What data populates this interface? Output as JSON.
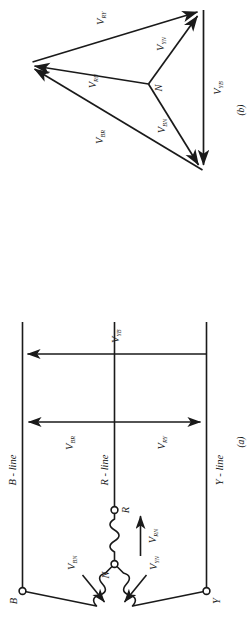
{
  "figure": {
    "title_a": "(a)",
    "title_b": "(b)"
  },
  "circuit_a": {
    "caption": "(a)",
    "nodes": [
      {
        "name": "neutral-node",
        "label": "N"
      },
      {
        "name": "r-terminal",
        "label": "R"
      },
      {
        "name": "y-terminal",
        "label": "Y"
      },
      {
        "name": "b-terminal",
        "label": "B"
      }
    ],
    "lines": [
      {
        "name": "r-line",
        "label": "R - line"
      },
      {
        "name": "y-line",
        "label": "Y - line"
      },
      {
        "name": "b-line",
        "label": "B - line"
      }
    ],
    "phase_voltages": [
      {
        "name": "v-rn",
        "base": "V",
        "sub": "RN"
      },
      {
        "name": "v-yn",
        "base": "V",
        "sub": "YN"
      },
      {
        "name": "v-bn",
        "base": "V",
        "sub": "BN"
      }
    ],
    "line_voltages": [
      {
        "name": "v-ry",
        "base": "V",
        "sub": "RY"
      },
      {
        "name": "v-yb",
        "base": "V",
        "sub": "YB"
      },
      {
        "name": "v-br",
        "base": "V",
        "sub": "BR"
      }
    ]
  },
  "phasor_b": {
    "caption": "(b)",
    "origin_label": "N",
    "phase_phasors": [
      {
        "name": "v-rn-phasor",
        "base": "V",
        "sub": "RN"
      },
      {
        "name": "v-yn-phasor",
        "base": "V",
        "sub": "YN"
      },
      {
        "name": "v-bn-phasor",
        "base": "V",
        "sub": "BN"
      }
    ],
    "line_phasors": [
      {
        "name": "v-ry-phasor",
        "base": "V",
        "sub": "RY"
      },
      {
        "name": "v-yb-phasor",
        "base": "V",
        "sub": "YB"
      },
      {
        "name": "v-br-phasor",
        "base": "V",
        "sub": "BR"
      }
    ]
  },
  "style": {
    "stroke": "#1a1a1a",
    "background": "#ffffff"
  }
}
